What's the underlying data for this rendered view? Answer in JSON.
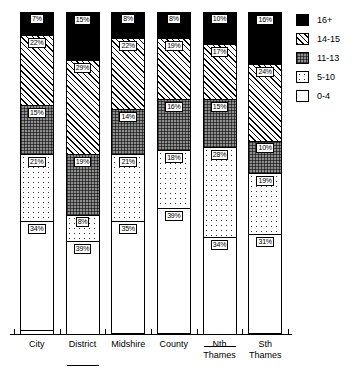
{
  "chart_data": {
    "type": "bar",
    "subtype": "stacked-percent",
    "title": "",
    "xlabel": "",
    "ylabel": "",
    "ylim": [
      0,
      100
    ],
    "grid": false,
    "legend_position": "right",
    "categories": [
      "City",
      "District",
      "Midshire",
      "County",
      "Nth Thames",
      "Sth Thames"
    ],
    "category_lines": [
      [
        "City"
      ],
      [
        "District"
      ],
      [
        "Midshire"
      ],
      [
        "County"
      ],
      [
        "Nth",
        "Thames"
      ],
      [
        "Sth",
        "Thames"
      ]
    ],
    "series": [
      {
        "name": "16+",
        "fill": "solid-black",
        "values": [
          7,
          15,
          8,
          8,
          10,
          16
        ]
      },
      {
        "name": "14-15",
        "fill": "diagonal-hatch",
        "values": [
          22,
          29,
          22,
          19,
          17,
          24
        ]
      },
      {
        "name": "11-13",
        "fill": "grey-cross",
        "values": [
          15,
          19,
          14,
          16,
          15,
          10
        ]
      },
      {
        "name": "5-10",
        "fill": "dotted",
        "values": [
          21,
          8,
          21,
          18,
          28,
          19
        ]
      },
      {
        "name": "0-4",
        "fill": "white",
        "values": [
          34,
          39,
          35,
          39,
          34,
          31
        ]
      }
    ],
    "value_labels": [
      [
        "7%",
        "22%",
        "15%",
        "21%",
        "34%"
      ],
      [
        "15%",
        "29%",
        "19%",
        "8%",
        "39%"
      ],
      [
        "8%",
        "22%",
        "14%",
        "21%",
        "35%"
      ],
      [
        "8%",
        "19%",
        "16%",
        "18%",
        "39%"
      ],
      [
        "10%",
        "17%",
        "15%",
        "28%",
        "34%"
      ],
      [
        "16%",
        "24%",
        "10%",
        "19%",
        "31%"
      ]
    ]
  },
  "legend": {
    "items": [
      {
        "label": "16+",
        "swatch": "legend-swatch-16plus"
      },
      {
        "label": "14-15",
        "swatch": "legend-swatch-14-15"
      },
      {
        "label": "11-13",
        "swatch": "legend-swatch-11-13"
      },
      {
        "label": "5-10",
        "swatch": "legend-swatch-5-10"
      },
      {
        "label": "0-4",
        "swatch": "legend-swatch-0-4"
      }
    ]
  },
  "colors": {
    "ink": "#000000",
    "background": "#ffffff",
    "band_11_13": "#8d8d8d"
  }
}
